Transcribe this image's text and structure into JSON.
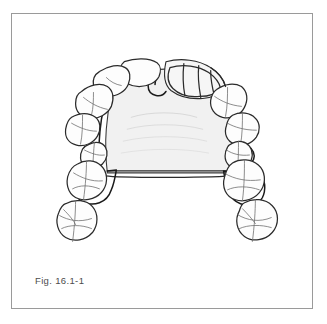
{
  "figure": {
    "caption": "Fig. 16.1-1",
    "view": "occlusal view of maxilla",
    "frame": {
      "border_color": "#9a9a9a",
      "background_color": "#ffffff"
    },
    "colors": {
      "outline": "#2b2b2b",
      "framework_outline": "#1a1a1a",
      "tooth_fissure": "#6f6f6f",
      "palate_fill": "#f2f2f2",
      "palate_fill_deep": "#ececec",
      "tooth_fill": "#fdfdfd",
      "prosthetic_fill": "#f6f6f6",
      "caption_text": "#4c4c4c"
    },
    "components": [
      {
        "id": "palatal-plate",
        "label": "Palatal major connector plate"
      },
      {
        "id": "posterior-palatal-bar",
        "label": "Posterior palatal strap"
      },
      {
        "id": "anterior-prosthetic-segment",
        "label": "Anterior prosthetic tooth segment"
      },
      {
        "id": "left-clasp-assembly",
        "label": "Left posterior clasp assembly"
      },
      {
        "id": "right-clasp-assembly",
        "label": "Right posterior clasp assembly"
      },
      {
        "id": "rest-seat-left",
        "label": "Left occlusal rest seat"
      },
      {
        "id": "rest-seat-right",
        "label": "Right occlusal rest seat"
      }
    ],
    "teeth": {
      "left": [
        {
          "id": "tooth-left-central-incisor",
          "label": "Left central incisor"
        },
        {
          "id": "tooth-left-lateral-incisor",
          "label": "Left lateral incisor"
        },
        {
          "id": "tooth-left-canine",
          "label": "Left canine"
        },
        {
          "id": "tooth-left-first-premolar",
          "label": "Left first premolar"
        },
        {
          "id": "tooth-left-second-premolar",
          "label": "Left second premolar"
        },
        {
          "id": "tooth-left-first-molar",
          "label": "Left first molar"
        },
        {
          "id": "tooth-left-second-molar",
          "label": "Left second molar"
        }
      ],
      "right": [
        {
          "id": "tooth-right-central-incisor",
          "label": "Right central incisor"
        },
        {
          "id": "tooth-right-lateral-incisor",
          "label": "Right lateral incisor"
        },
        {
          "id": "tooth-right-canine",
          "label": "Right canine"
        },
        {
          "id": "tooth-right-first-premolar",
          "label": "Right first premolar"
        },
        {
          "id": "tooth-right-second-premolar",
          "label": "Right second premolar"
        },
        {
          "id": "tooth-right-first-molar",
          "label": "Right first molar"
        },
        {
          "id": "tooth-right-second-molar",
          "label": "Right second molar"
        }
      ]
    },
    "prosthetic_segment_divisions": 4
  }
}
